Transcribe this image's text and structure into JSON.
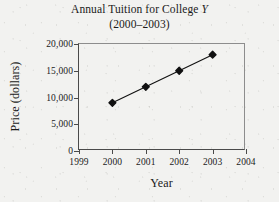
{
  "chart_data": {
    "type": "line",
    "title": "Annual Tuition for College Y",
    "title_plain": "Annual Tuition for College ",
    "title_italic": "Y",
    "subtitle": "(2000–2003)",
    "xlabel": "Year",
    "ylabel": "Price (dollars)",
    "x": [
      2000,
      2001,
      2002,
      2003
    ],
    "values": [
      9000,
      12000,
      15000,
      18000
    ],
    "series": [
      {
        "name": "Annual Tuition",
        "values": [
          9000,
          12000,
          15000,
          18000
        ]
      }
    ],
    "xlim": [
      1999,
      2004
    ],
    "ylim": [
      0,
      20000
    ],
    "xticks": [
      1999,
      2000,
      2001,
      2002,
      2003,
      2004
    ],
    "xtick_labels": [
      "1999",
      "2000",
      "2001",
      "2002",
      "2003",
      "2004"
    ],
    "yticks": [
      0,
      5000,
      10000,
      15000,
      20000
    ],
    "ytick_labels": [
      "0",
      "5,000",
      "10,000",
      "15,000",
      "20,000"
    ],
    "grid": false,
    "legend": false,
    "legend_position": "none",
    "marker": "diamond",
    "marker_color": "#111111",
    "line_color": "#111111",
    "background_color": "#f2f2f0"
  }
}
